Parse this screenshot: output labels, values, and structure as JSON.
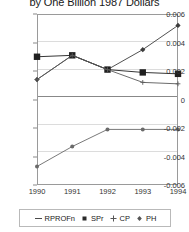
{
  "chart": {
    "title": "by One Billion 1987 Dollars",
    "frame_border_color": "#9a9a9a",
    "grid_color": "#dcdcdc"
  },
  "axes": {
    "y_ticks": [
      "0.006",
      "0.004",
      "0.002",
      "0",
      "-0.002",
      "-0.004",
      "-0.006"
    ],
    "x_ticks": [
      "1990",
      "1991",
      "1992",
      "1993",
      "1994"
    ]
  },
  "legend": {
    "items": [
      {
        "label": "RPROFn",
        "marker": "dash-marker",
        "color": "#4a4a4a"
      },
      {
        "label": "SPr",
        "marker": "square-marker",
        "color": "#2b2b2b"
      },
      {
        "label": "CP",
        "marker": "plus-marker",
        "color": "#555555"
      },
      {
        "label": "PH",
        "marker": "small-diamond-marker",
        "color": "#555555"
      }
    ]
  },
  "chart_data": {
    "type": "line",
    "title": "by One Billion 1987 Dollars",
    "xlabel": "",
    "ylabel": "",
    "x": [
      1990,
      1991,
      1992,
      1993,
      1994
    ],
    "ylim": [
      -0.006,
      0.006
    ],
    "xlim": [
      1990,
      1994
    ],
    "grid": true,
    "legend_position": "bottom",
    "series": [
      {
        "name": "RPROFn",
        "values": [
          0.0014,
          0.0031,
          0.0021,
          0.0035,
          0.0052
        ]
      },
      {
        "name": "SPr",
        "values": [
          0.003,
          0.0031,
          0.0021,
          0.0019,
          0.0018
        ]
      },
      {
        "name": "CP",
        "values": [
          0.0014,
          0.0031,
          0.0021,
          0.0012,
          0.0011
        ]
      },
      {
        "name": "PH",
        "values": [
          -0.0047,
          -0.0033,
          -0.0021,
          -0.0021,
          -0.0021
        ]
      }
    ]
  }
}
